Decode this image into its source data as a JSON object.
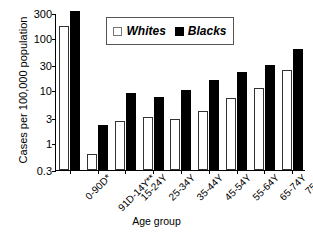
{
  "chart_data": {
    "type": "bar",
    "title": "",
    "xlabel": "Age group",
    "ylabel": "Cases per 100,000 population",
    "yscale": "log",
    "ylim": [
      0.3,
      300
    ],
    "yticks": [
      0.3,
      1,
      3,
      10,
      30,
      100,
      300
    ],
    "ytick_labels": [
      "0.3",
      "1",
      "3",
      "10",
      "30",
      "100",
      "300"
    ],
    "grid": false,
    "legend_position": "top-center",
    "categories": [
      "0-90D*",
      "91D-14Y**",
      "15-24Y",
      "25-34Y",
      "35-44Y",
      "45-54Y",
      "55-64Y",
      "65-74Y",
      "75+Y"
    ],
    "series": [
      {
        "name": "Whites",
        "color": "#ffffff",
        "values": [
          170,
          0.6,
          2.6,
          3.1,
          2.8,
          4.0,
          7.0,
          11.0,
          24.0
        ]
      },
      {
        "name": "Blacks",
        "color": "#000000",
        "values": [
          330,
          2.2,
          9.0,
          7.5,
          10.0,
          16.0,
          22.0,
          30.0,
          62.0
        ]
      }
    ]
  },
  "legend": {
    "entries": [
      {
        "label": "Whites",
        "swatch": "open-square-icon"
      },
      {
        "label": "Blacks",
        "swatch": "filled-square-icon"
      }
    ]
  }
}
